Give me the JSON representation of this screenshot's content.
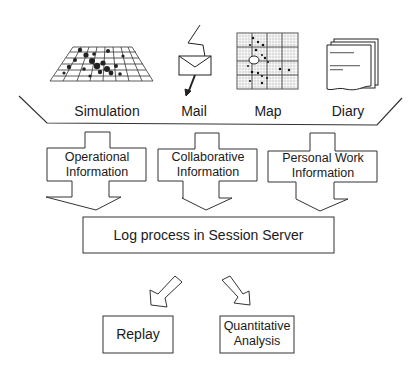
{
  "sources": [
    {
      "label": "Simulation",
      "icon": "simulation-grid-icon"
    },
    {
      "label": "Mail",
      "icon": "mail-envelope-icon"
    },
    {
      "label": "Map",
      "icon": "map-grid-icon"
    },
    {
      "label": "Diary",
      "icon": "diary-pages-icon"
    }
  ],
  "information_types": [
    {
      "line1": "Operational",
      "line2": "Information"
    },
    {
      "line1": "Collaborative",
      "line2": "Information"
    },
    {
      "line1": "Personal Work",
      "line2": "Information"
    }
  ],
  "process": {
    "label": "Log process in Session Server"
  },
  "outputs": [
    {
      "line1": "Replay"
    },
    {
      "line1": "Quantitative",
      "line2": "Analysis"
    }
  ],
  "colors": {
    "line": "#333333",
    "background": "#ffffff"
  }
}
